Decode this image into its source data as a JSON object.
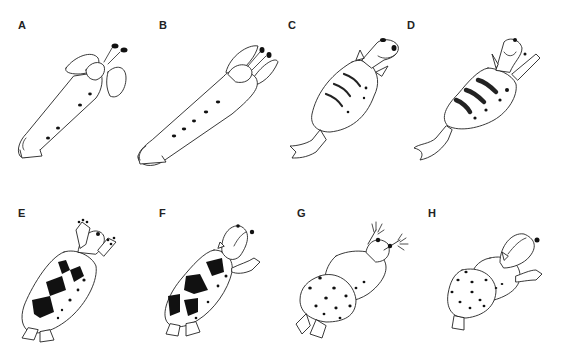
{
  "figure": {
    "panels": [
      {
        "label": "A",
        "pigment": "4 small dots along body"
      },
      {
        "label": "B",
        "pigment": "5 small dots along body"
      },
      {
        "label": "C",
        "pigment": "3 thin transverse stripes, scattered dots"
      },
      {
        "label": "D",
        "pigment": "3 thick transverse bars, scattered dots"
      },
      {
        "label": "E",
        "pigment": "large irregular black patches, dots"
      },
      {
        "label": "F",
        "pigment": "large black patches, dots"
      },
      {
        "label": "G",
        "pigment": "numerous spots on rounded posterior"
      },
      {
        "label": "H",
        "pigment": "numerous small spots on rounded posterior"
      }
    ]
  }
}
